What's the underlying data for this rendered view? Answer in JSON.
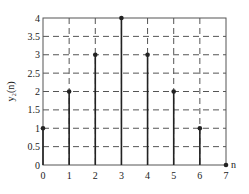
{
  "chart_data": {
    "type": "stem",
    "title": "",
    "xlabel": "n",
    "ylabel": "y₂(n)",
    "x": [
      0,
      1,
      2,
      3,
      4,
      5,
      6,
      7
    ],
    "values": [
      1,
      2,
      3,
      4,
      3,
      2,
      1,
      0
    ],
    "xlim": [
      0,
      7
    ],
    "ylim": [
      0,
      4
    ],
    "x_ticks": [
      "0",
      "1",
      "2",
      "3",
      "4",
      "5",
      "6",
      "7"
    ],
    "y_ticks": [
      "0",
      "0.5",
      "1",
      "1.5",
      "2",
      "2.5",
      "3",
      "3.5",
      "4"
    ],
    "grid": "dashed",
    "legend": null
  },
  "colors": {
    "stem": "#222222",
    "grid": "#555555",
    "frame": "#555555"
  }
}
